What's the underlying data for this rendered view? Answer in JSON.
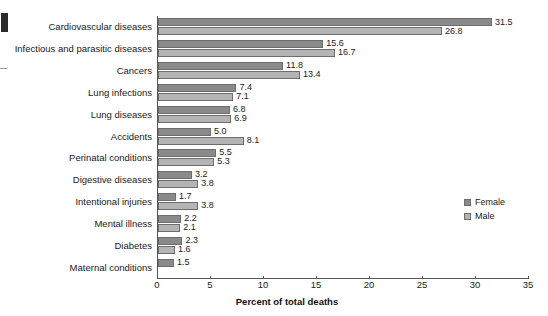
{
  "chart_data": {
    "type": "bar",
    "orientation": "horizontal",
    "title": "",
    "xlabel": "Percent of total deaths",
    "ylabel": "",
    "xlim": [
      0,
      35
    ],
    "xticks": [
      0,
      5,
      10,
      15,
      20,
      25,
      30,
      35
    ],
    "grid": false,
    "legend_position": "right",
    "categories": [
      "Cardiovascular diseases",
      "Infectious and parasitic diseases",
      "Cancers",
      "Lung infections",
      "Lung diseases",
      "Accidents",
      "Perinatal conditions",
      "Digestive diseases",
      "Intentional injuries",
      "Mental illness",
      "Diabetes",
      "Maternal conditions"
    ],
    "series": [
      {
        "name": "Female",
        "color": "#8a8a8a",
        "values": [
          31.5,
          15.6,
          11.8,
          7.4,
          6.8,
          5.0,
          5.5,
          3.2,
          1.7,
          2.2,
          2.3,
          1.5
        ]
      },
      {
        "name": "Male",
        "color": "#b4b4b4",
        "values": [
          26.8,
          16.7,
          13.4,
          7.1,
          6.9,
          8.1,
          5.3,
          3.8,
          3.8,
          2.1,
          1.6,
          null
        ]
      }
    ]
  },
  "legend": {
    "items": [
      {
        "label": "Female",
        "color": "#8a8a8a"
      },
      {
        "label": "Male",
        "color": "#b4b4b4"
      }
    ]
  }
}
